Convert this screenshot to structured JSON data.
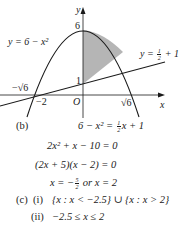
{
  "graph": {
    "axes": {
      "x_label": "x",
      "y_label": "y",
      "origin_label": "O"
    },
    "curve_label": "y = 6 − x²",
    "line_label_prefix": "y = ",
    "line_label_num": "1",
    "line_label_den": "2",
    "line_label_suffix": " + 1",
    "tick_labels": {
      "y_6": "6",
      "y_1": "1",
      "x_neg_sqrt6": "−√6",
      "x_neg2": "−2",
      "x_sqrt6": "√6"
    },
    "colors": {
      "shade": "#b5b5b5",
      "ink": "#1a1a1a"
    }
  },
  "solution": {
    "part_b_label": "(b)",
    "b_line1_left": "6 − x² = ",
    "b_line1_num": "1",
    "b_line1_den": "2",
    "b_line1_right": "x + 1",
    "b_line2": "2x² + x − 10 = 0",
    "b_line3": "(2x + 5)(x − 2) = 0",
    "b_line4_left": "x = −",
    "b_line4_num": "5",
    "b_line4_den": "2",
    "b_line4_right": " or x = 2",
    "part_c_label": "(c)",
    "c_i_label": "(i)",
    "c_i": "{x : x < −2.5} ∪ {x : x > 2}",
    "c_ii_label": "(ii)",
    "c_ii": "−2.5 ≤ x ≤ 2"
  }
}
